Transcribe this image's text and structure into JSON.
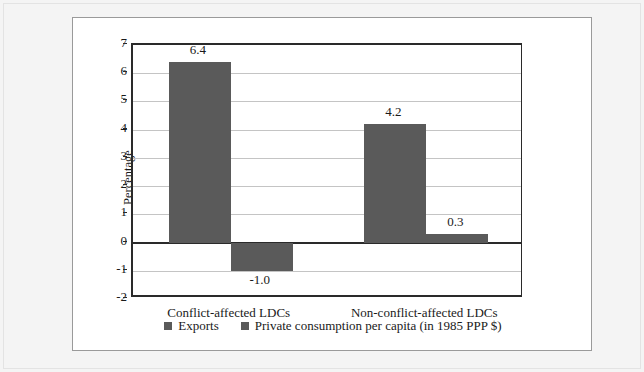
{
  "chart_data": {
    "type": "bar",
    "title": "",
    "xlabel": "",
    "ylabel": "Percentage",
    "ylim": [
      -2,
      7
    ],
    "ytick_labels": [
      "7",
      "6",
      "5",
      "4",
      "3",
      "2",
      "1",
      "0",
      "-1",
      "-2"
    ],
    "ytick_values": [
      7,
      6,
      5,
      4,
      3,
      2,
      1,
      0,
      -1,
      -2
    ],
    "grid": true,
    "legend_position": "bottom",
    "categories": [
      "Conflict-affected LDCs",
      "Non-conflict-affected LDCs"
    ],
    "series": [
      {
        "name": "Exports",
        "color": "#5a5a5a",
        "values": [
          6.4,
          4.2
        ],
        "value_labels": [
          "6.4",
          "4.2"
        ]
      },
      {
        "name": "Private consumption per capita (in 1985 PPP $)",
        "color": "#5a5a5a",
        "values": [
          -1.0,
          0.3
        ],
        "value_labels": [
          "-1.0",
          "0.3"
        ]
      }
    ]
  },
  "colors": {
    "bar_fill": "#5a5a5a",
    "axis": "#2a2a2a",
    "gridline": "#c4c4c4",
    "panel_background": "#ffffff",
    "outer_background": "#f4f4f4"
  }
}
